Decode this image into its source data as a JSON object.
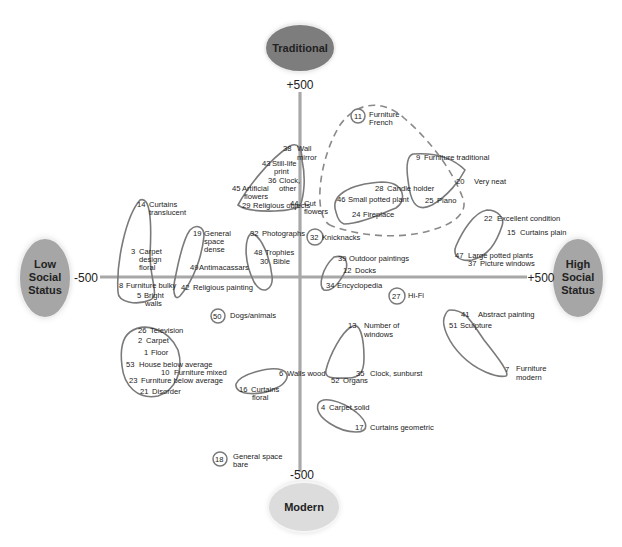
{
  "axes": {
    "top_pole": "Traditional",
    "bottom_pole": "Modern",
    "left_pole": [
      "Low",
      "Social",
      "Status"
    ],
    "right_pole": [
      "High",
      "Social",
      "Status"
    ],
    "top_value": "+500",
    "bottom_value": "-500",
    "left_value": "-500",
    "right_value": "+500"
  },
  "colors": {
    "traditional_pole": "#7d7d7d",
    "modern_pole": "#dcdcdc",
    "status_poles": "#a6a6a6",
    "axis_line": "#a8a8a8",
    "outline": "#7a7a7a"
  },
  "items": [
    {
      "n": "38",
      "label": [
        "Wall",
        "mirror"
      ]
    },
    {
      "n": "43",
      "label": [
        "Still-life",
        "print"
      ]
    },
    {
      "n": "36",
      "label": [
        "Clock,",
        "other"
      ]
    },
    {
      "n": "45",
      "label": [
        "Artificial",
        "flowers"
      ]
    },
    {
      "n": "29",
      "label": [
        "Religious objects"
      ]
    },
    {
      "n": "44",
      "label": [
        "Cut",
        "flowers"
      ]
    },
    {
      "n": "11",
      "label": [
        "Furniture",
        "French"
      ]
    },
    {
      "n": "9",
      "label": [
        "Furniture traditional"
      ]
    },
    {
      "n": "20",
      "label": [
        "Very neat"
      ]
    },
    {
      "n": "28",
      "label": [
        "Candle holder"
      ]
    },
    {
      "n": "46",
      "label": [
        "Small potted plant"
      ]
    },
    {
      "n": "25",
      "label": [
        "Piano"
      ]
    },
    {
      "n": "24",
      "label": [
        "Fireplace"
      ]
    },
    {
      "n": "14",
      "label": [
        "Curtains",
        "translucent"
      ]
    },
    {
      "n": "3",
      "label": [
        "Carpet",
        "design",
        "floral"
      ]
    },
    {
      "n": "8",
      "label": [
        "Furniture bulky"
      ]
    },
    {
      "n": "5",
      "label": [
        "Bright",
        "walls"
      ]
    },
    {
      "n": "19",
      "label": [
        "General",
        "space",
        "dense"
      ]
    },
    {
      "n": "49",
      "label": [
        "Antimacassars"
      ]
    },
    {
      "n": "42",
      "label": [
        "Religious painting"
      ]
    },
    {
      "n": "32",
      "label": [
        "Photographs"
      ]
    },
    {
      "n": "48",
      "label": [
        "Trophies"
      ]
    },
    {
      "n": "30",
      "label": [
        "Bible"
      ]
    },
    {
      "n": "32",
      "label": [
        "Knicknacks"
      ]
    },
    {
      "n": "39",
      "label": [
        "Outdoor paintings"
      ]
    },
    {
      "n": "12",
      "label": [
        "Docks"
      ]
    },
    {
      "n": "34",
      "label": [
        "Encyclopedia"
      ]
    },
    {
      "n": "22",
      "label": [
        "Excellent condition"
      ]
    },
    {
      "n": "15",
      "label": [
        "Curtains plain"
      ]
    },
    {
      "n": "47",
      "label": [
        "Large potted plants"
      ]
    },
    {
      "n": "37",
      "label": [
        "Picture windows"
      ]
    },
    {
      "n": "27",
      "label": [
        "Hi-Fi"
      ]
    },
    {
      "n": "50",
      "label": [
        "Dogs/animals"
      ]
    },
    {
      "n": "41",
      "label": [
        "Abstract painting"
      ]
    },
    {
      "n": "51",
      "label": [
        "Sculpture"
      ]
    },
    {
      "n": "7",
      "label": [
        "Furniture",
        "modern"
      ]
    },
    {
      "n": "13",
      "label": [
        "Number of",
        "windows"
      ]
    },
    {
      "n": "35",
      "label": [
        "Clock, sunburst"
      ]
    },
    {
      "n": "52",
      "label": [
        "Organs"
      ]
    },
    {
      "n": "26",
      "label": [
        "Television"
      ]
    },
    {
      "n": "2",
      "label": [
        "Carpet"
      ]
    },
    {
      "n": "1",
      "label": [
        "Floor"
      ]
    },
    {
      "n": "53",
      "label": [
        "House below average"
      ]
    },
    {
      "n": "10",
      "label": [
        "Furniture mixed"
      ]
    },
    {
      "n": "23",
      "label": [
        "Furniture below average"
      ]
    },
    {
      "n": "21",
      "label": [
        "Disorder"
      ]
    },
    {
      "n": "6",
      "label": [
        "Walls wood"
      ]
    },
    {
      "n": "16",
      "label": [
        "Curtains",
        "floral"
      ]
    },
    {
      "n": "4",
      "label": [
        "Carpet solid"
      ]
    },
    {
      "n": "17",
      "label": [
        "Curtains geometric"
      ]
    },
    {
      "n": "18",
      "label": [
        "General space",
        "bare"
      ]
    }
  ]
}
